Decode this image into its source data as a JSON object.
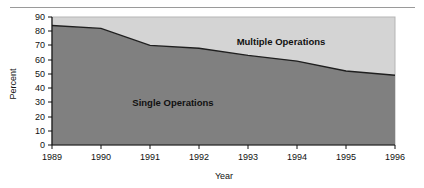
{
  "chart_data": {
    "type": "area",
    "stacked": true,
    "title": "",
    "xlabel": "Year",
    "ylabel": "Percent",
    "categories": [
      "1989",
      "1990",
      "1991",
      "1992",
      "1993",
      "1994",
      "1995",
      "1996"
    ],
    "x": [
      1989,
      1990,
      1991,
      1992,
      1993,
      1994,
      1995,
      1996
    ],
    "xlim": [
      1989,
      1996
    ],
    "ylim": [
      0,
      90
    ],
    "yticks": [
      0,
      10,
      20,
      30,
      40,
      50,
      60,
      70,
      80,
      90
    ],
    "ytick_labels": [
      "0",
      "10",
      "20",
      "30",
      "40",
      "50",
      "60",
      "70",
      "80",
      "90"
    ],
    "grid": false,
    "legend_position": "inline-annotation",
    "series": [
      {
        "name": "Single Operations",
        "values": [
          84,
          82,
          70,
          68,
          63,
          59,
          52,
          49
        ],
        "color": "#808080",
        "label_position": "inside-lower-left"
      },
      {
        "name": "Multiple Operations",
        "values": [
          6,
          8,
          20,
          22,
          27,
          31,
          38,
          41
        ],
        "color": "#d4d4d4",
        "label_position": "inside-upper-right"
      }
    ],
    "annotations": [
      {
        "text": "Single Operations",
        "x": 1991.1,
        "y": 28
      },
      {
        "text": "Multiple Operations",
        "x": 1993.4,
        "y": 81
      }
    ]
  },
  "axes": {
    "y_title": "Percent",
    "x_title": "Year",
    "y_tick_labels": [
      "90",
      "80",
      "70",
      "60",
      "50",
      "40",
      "30",
      "20",
      "10",
      "0"
    ],
    "x_tick_labels": [
      "1989",
      "1990",
      "1991",
      "1992",
      "1993",
      "1994",
      "1995",
      "1996"
    ]
  },
  "colors": {
    "single_operations": "#808080",
    "multiple_operations": "#d4d4d4",
    "axis": "#111111",
    "boundary_line": "#1a1a1a",
    "top_rule": "#9a9a9a",
    "plot_border": "#b0b0b0"
  },
  "labels": {
    "single_operations": "Single Operations",
    "multiple_operations": "Multiple Operations"
  }
}
